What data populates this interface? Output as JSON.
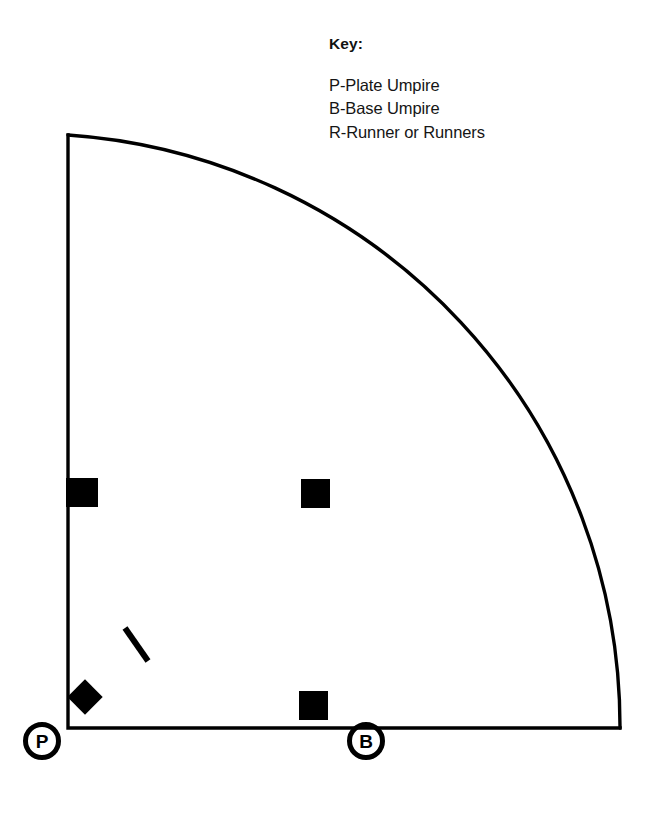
{
  "figure": {
    "kind": "baseball-field-quadrant-diagram",
    "background_color": "#ffffff",
    "line_color": "#000000"
  },
  "key": {
    "title": "Key:",
    "entries": [
      "P-Plate Umpire",
      "B-Base Umpire",
      "R-Runner or Runners"
    ]
  },
  "field": {
    "foul_line_left": {
      "name": "third-base-foul-line",
      "x1": 68,
      "y1": 135,
      "x2": 68,
      "y2": 728
    },
    "foul_line_bottom": {
      "name": "first-base-foul-line",
      "x1": 68,
      "y1": 728,
      "x2": 620,
      "y2": 728
    },
    "outfield_arc": {
      "name": "outfield-fence-arc",
      "center_x": 68,
      "center_y": 728,
      "radius": 593,
      "start_x": 68,
      "start_y": 135,
      "end_x": 620,
      "end_y": 728
    },
    "stroke_width": 3.4
  },
  "markers": {
    "home_plate": {
      "label": "home-plate",
      "center_x": 85,
      "center_y": 697,
      "size": 25,
      "rotation_deg": 45,
      "color": "#000000"
    },
    "bases": [
      {
        "label": "third-base",
        "x": 66,
        "y": 478,
        "width": 32,
        "height": 29,
        "color": "#000000"
      },
      {
        "label": "second-base",
        "x": 301,
        "y": 479,
        "width": 29,
        "height": 29,
        "color": "#000000"
      },
      {
        "label": "first-base",
        "x": 299,
        "y": 691,
        "width": 29,
        "height": 29,
        "color": "#000000"
      }
    ],
    "pitcher_mark": {
      "label": "pitcher-position-mark",
      "x1": 125,
      "y1": 628,
      "x2": 148,
      "y2": 661,
      "stroke_width": 6,
      "color": "#000000"
    }
  },
  "position_badges": [
    {
      "id": "plate-umpire",
      "letter": "P",
      "center_x": 42,
      "center_y": 741,
      "radius": 19,
      "ring_width": 5,
      "color": "#000000"
    },
    {
      "id": "base-umpire",
      "letter": "B",
      "center_x": 366,
      "center_y": 741,
      "radius": 19,
      "ring_width": 5,
      "color": "#000000"
    }
  ]
}
